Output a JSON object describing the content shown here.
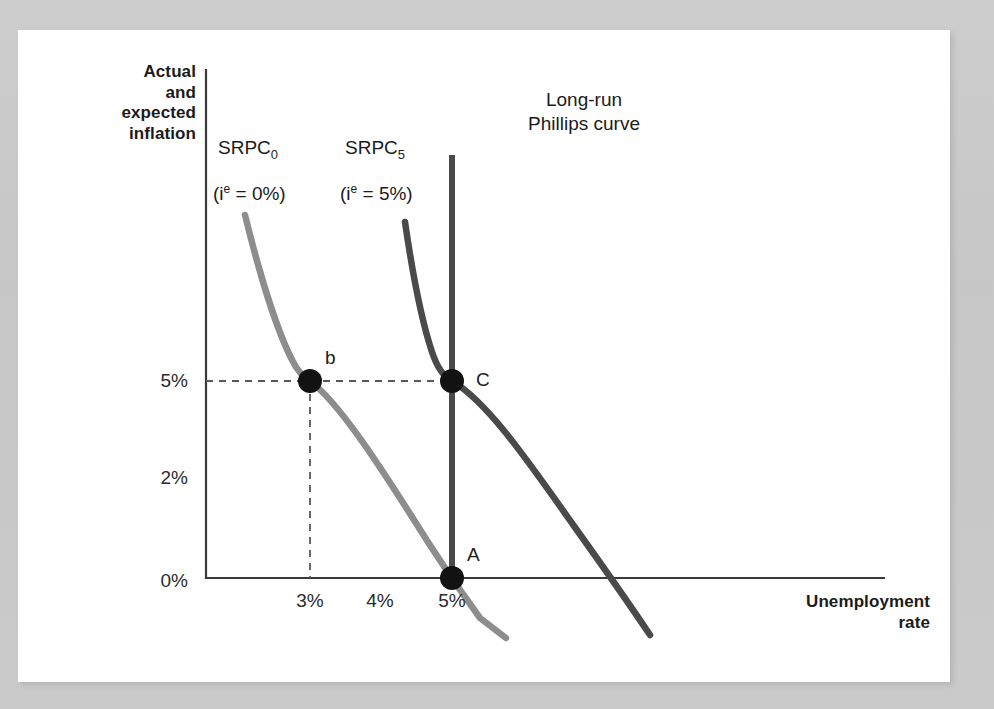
{
  "figure": {
    "background_color": "#c9c9c9",
    "panel_color": "#ffffff"
  },
  "axes": {
    "y_title": "Actual\nand\nexpected\ninflation",
    "x_title": "Unemployment\nrate",
    "y_ticks": [
      "5%",
      "2%",
      "0%"
    ],
    "x_ticks": [
      "3%",
      "4%",
      "5%"
    ]
  },
  "curves": {
    "srpc0": {
      "name": "SRPC",
      "subscript": "0",
      "condition_prefix": "(i",
      "condition_sup": "e",
      "condition_suffix": " = 0%)",
      "color": "#8d8d8d"
    },
    "srpc5": {
      "name": "SRPC",
      "subscript": "5",
      "condition_prefix": "(i",
      "condition_sup": "e",
      "condition_suffix": " = 5%)",
      "color": "#4a4a4a"
    },
    "lrpc": {
      "label_line1": "Long-run",
      "label_line2": "Phillips curve",
      "color": "#4a4a4a"
    }
  },
  "points": {
    "b": "b",
    "C": "C",
    "A": "A"
  },
  "chart_data": {
    "type": "line",
    "title": "",
    "xlabel": "Unemployment rate",
    "ylabel": "Actual and expected inflation",
    "xlim": [
      2.0,
      7.8
    ],
    "ylim": [
      -1.6,
      11.0
    ],
    "x_tick_values": [
      3,
      4,
      5
    ],
    "x_tick_labels": [
      "3%",
      "4%",
      "5%"
    ],
    "y_tick_values": [
      0,
      2,
      5
    ],
    "y_tick_labels": [
      "0%",
      "2%",
      "5%"
    ],
    "grid": false,
    "legend": "inline-annotations",
    "series": [
      {
        "name": "SRPC0 (i^e = 0%)",
        "color": "#8d8d8d",
        "type": "short-run Phillips curve, expected inflation 0%",
        "points": [
          {
            "x": 2.45,
            "y": 9.0
          },
          {
            "x": 2.65,
            "y": 7.4
          },
          {
            "x": 2.85,
            "y": 5.9
          },
          {
            "x": 3.0,
            "y": 5.0
          },
          {
            "x": 3.4,
            "y": 3.4
          },
          {
            "x": 3.9,
            "y": 2.1
          },
          {
            "x": 4.4,
            "y": 1.1
          },
          {
            "x": 5.0,
            "y": 0.0
          },
          {
            "x": 5.4,
            "y": -0.85
          },
          {
            "x": 5.75,
            "y": -1.45
          }
        ]
      },
      {
        "name": "SRPC5 (i^e = 5%)",
        "color": "#4a4a4a",
        "type": "short-run Phillips curve, expected inflation 5%",
        "points": [
          {
            "x": 4.15,
            "y": 8.8
          },
          {
            "x": 4.3,
            "y": 7.6
          },
          {
            "x": 4.55,
            "y": 6.3
          },
          {
            "x": 5.0,
            "y": 5.0
          },
          {
            "x": 5.5,
            "y": 3.6
          },
          {
            "x": 6.0,
            "y": 2.3
          },
          {
            "x": 6.5,
            "y": 1.0
          },
          {
            "x": 6.85,
            "y": 0.0
          },
          {
            "x": 7.3,
            "y": -1.6
          }
        ]
      },
      {
        "name": "Long-run Phillips curve",
        "color": "#4a4a4a",
        "type": "vertical line at natural rate of unemployment",
        "points": [
          {
            "x": 5.0,
            "y": 10.0
          },
          {
            "x": 5.0,
            "y": 0.0
          }
        ]
      }
    ],
    "annotated_points": [
      {
        "label": "b",
        "x": 3,
        "y": 5,
        "x_text": "3%",
        "y_text": "5%",
        "on_curve": "SRPC0"
      },
      {
        "label": "C",
        "x": 5,
        "y": 5,
        "x_text": "5%",
        "y_text": "5%",
        "on_curve": "SRPC5 / LRPC"
      },
      {
        "label": "A",
        "x": 5,
        "y": 0,
        "x_text": "5%",
        "y_text": "0%",
        "on_curve": "SRPC0 / LRPC"
      }
    ],
    "guide_lines": [
      {
        "type": "horizontal-dashed",
        "from": {
          "x": 2.0,
          "y": 5
        },
        "to": {
          "x": 5.0,
          "y": 5
        },
        "label": "5% inflation level"
      },
      {
        "type": "vertical-dashed",
        "from": {
          "x": 3,
          "y": 5
        },
        "to": {
          "x": 3,
          "y": 0
        },
        "label": "3% unemployment"
      }
    ]
  }
}
